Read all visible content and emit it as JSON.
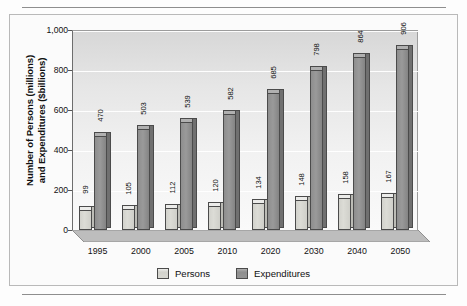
{
  "chart_data": {
    "type": "bar",
    "title": "",
    "subtitle": "",
    "xlabel": "",
    "ylabel": "Number of Persons (millions) and Expenditures ($billions)",
    "ylabel_line1": "Number of Persons (millions)",
    "ylabel_line2": "and Expenditures ($billions)",
    "categories": [
      "1995",
      "2000",
      "2005",
      "2010",
      "2020",
      "2030",
      "2040",
      "2050"
    ],
    "series": [
      {
        "name": "Persons",
        "color": "#d2d2cc",
        "values": [
          99,
          105,
          112,
          120,
          134,
          148,
          158,
          167
        ]
      },
      {
        "name": "Expenditures",
        "color": "#8e8e8e",
        "values": [
          470,
          503,
          539,
          582,
          685,
          798,
          864,
          906
        ]
      }
    ],
    "ylim": [
      0,
      1000
    ],
    "yticks": [
      0,
      200,
      400,
      600,
      800,
      1000
    ],
    "ytick_labels": [
      "0",
      "200",
      "400",
      "600",
      "800",
      "1,000"
    ],
    "grid": true,
    "grid_color": "#ffffff",
    "legend_position": "bottom",
    "bar_style": "3d",
    "plot_background": "#e6e6e6"
  },
  "legend": {
    "items": [
      {
        "label": "Persons",
        "swatch": "persons"
      },
      {
        "label": "Expenditures",
        "swatch": "expend"
      }
    ]
  }
}
